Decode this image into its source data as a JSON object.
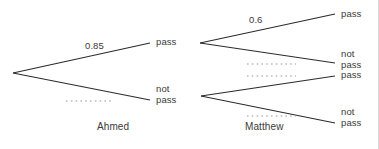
{
  "diagram": {
    "stroke_color": "#2b2b2b",
    "dotted_color": "#9a9a9a",
    "text_color": "#3a3a3a",
    "background": "#ffffff"
  },
  "stage1": {
    "name": "Ahmed",
    "node": {
      "x": 13,
      "y": 73
    },
    "branches": [
      {
        "id": "ahmed-pass",
        "outcome": "pass",
        "probability": "0.85",
        "probability_shown": true,
        "label_x": 156,
        "label_y": 38,
        "prob_x": 85,
        "prob_y": 42,
        "end_x": 150,
        "end_y": 43
      },
      {
        "id": "ahmed-not-pass",
        "outcome": "not\npass",
        "probability": "",
        "probability_shown": false,
        "label_x": 156,
        "label_y": 85,
        "prob_x": 66,
        "prob_y": 96,
        "end_x": 150,
        "end_y": 100,
        "dotted": {
          "x1": 66,
          "y1": 101,
          "x2": 112,
          "y2": 101
        }
      }
    ]
  },
  "stage2": {
    "name": "Matthew",
    "nodes": [
      {
        "id": "matthew-upper",
        "x": 200,
        "y": 43
      },
      {
        "id": "matthew-lower",
        "x": 201,
        "y": 96
      }
    ],
    "branches": [
      {
        "id": "matthew-upper-pass",
        "outcome": "pass",
        "probability": "0.6",
        "probability_shown": true,
        "label_x": 341,
        "label_y": 10,
        "prob_x": 249,
        "prob_y": 16,
        "from": 0,
        "end_x": 335,
        "end_y": 14
      },
      {
        "id": "matthew-upper-not-pass",
        "outcome": "not\npass",
        "probability": "",
        "probability_shown": false,
        "label_x": 341,
        "label_y": 50,
        "from": 0,
        "end_x": 335,
        "end_y": 63,
        "dotted": {
          "x1": 247,
          "y1": 64,
          "x2": 296,
          "y2": 64
        }
      },
      {
        "id": "matthew-lower-pass",
        "outcome": "pass",
        "probability": "",
        "probability_shown": false,
        "label_x": 341,
        "label_y": 71,
        "from": 1,
        "end_x": 335,
        "end_y": 76,
        "dotted": {
          "x1": 247,
          "y1": 76,
          "x2": 296,
          "y2": 76
        }
      },
      {
        "id": "matthew-lower-not-pass",
        "outcome": "not\npass",
        "probability": "",
        "probability_shown": false,
        "label_x": 341,
        "label_y": 108,
        "from": 1,
        "end_x": 335,
        "end_y": 123,
        "dotted": {
          "x1": 247,
          "y1": 116,
          "x2": 296,
          "y2": 116
        }
      }
    ]
  },
  "labels": {
    "ahmed_pass": "pass",
    "ahmed_not_pass": "not\npass",
    "ahmed_prob": "0.85",
    "matthew_prob": "0.6",
    "m1_pass": "pass",
    "m1_not_pass": "not\npass",
    "m2_pass": "pass",
    "m2_not_pass": "not\npass",
    "stage1_name": "Ahmed",
    "stage2_name": "Matthew"
  }
}
